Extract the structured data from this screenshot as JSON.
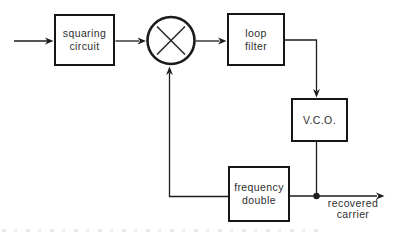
{
  "colors": {
    "ink": "#1c1c1c",
    "background": "#ffffff",
    "text": "#2e2e2e"
  },
  "blocks": {
    "squaring_circuit": {
      "label": "squaring\ncircuit"
    },
    "loop_filter": {
      "label": "loop\nfilter"
    },
    "vco": {
      "label": "V.C.O."
    },
    "frequency_doubler": {
      "label": "frequency\ndouble"
    }
  },
  "labels": {
    "output": "recovered\ncarrier"
  },
  "symbols": {
    "multiplier": "circle-with-x-multiplier"
  }
}
